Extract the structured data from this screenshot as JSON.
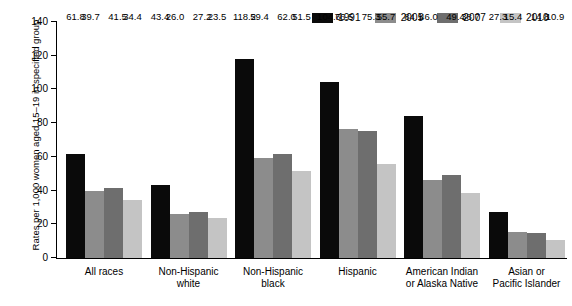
{
  "chart_data": {
    "type": "bar",
    "title": "",
    "xlabel": "",
    "ylabel": "Rates per 1,000 women aged 15–19 in specified group",
    "ylim": [
      0,
      140
    ],
    "yticks": [
      0,
      20,
      40,
      60,
      80,
      100,
      120,
      140
    ],
    "grid": false,
    "legend_position": "top-right",
    "categories": [
      "All races",
      "Non-Hispanic\nwhite",
      "Non-Hispanic\nblack",
      "Hispanic",
      "American Indian\nor Alaska Native",
      "Asian or\nPacific Islander"
    ],
    "series": [
      {
        "name": "1991",
        "color": "#0a0a0a",
        "values": [
          61.8,
          43.4,
          118.2,
          104.6,
          84.1,
          27.3
        ]
      },
      {
        "name": "2005",
        "color": "#8c8c8c",
        "values": [
          39.7,
          26.0,
          59.4,
          76.5,
          46.0,
          15.4
        ]
      },
      {
        "name": "2007",
        "color": "#6e6e6e",
        "values": [
          41.5,
          27.2,
          62.0,
          75.3,
          49.4,
          14.8
        ]
      },
      {
        "name": "2010",
        "color": "#c4c4c4",
        "values": [
          34.4,
          23.5,
          51.5,
          55.7,
          38.7,
          10.9
        ]
      }
    ],
    "value_labels": [
      [
        "61.8",
        "39.7",
        "41.5",
        "34.4"
      ],
      [
        "43.4",
        "26.0",
        "27.2",
        "23.5"
      ],
      [
        "118.2",
        "59.4",
        "62.0",
        "51.5"
      ],
      [
        "104.6",
        "76.5",
        "75.3",
        "55.7"
      ],
      [
        "84.1",
        "46.0",
        "49.4",
        "38.7"
      ],
      [
        "27.3",
        "15.4",
        "14.8",
        "10.9"
      ]
    ],
    "ytick_labels": [
      "0",
      "20",
      "40",
      "60",
      "80",
      "100",
      "120",
      "140"
    ]
  }
}
